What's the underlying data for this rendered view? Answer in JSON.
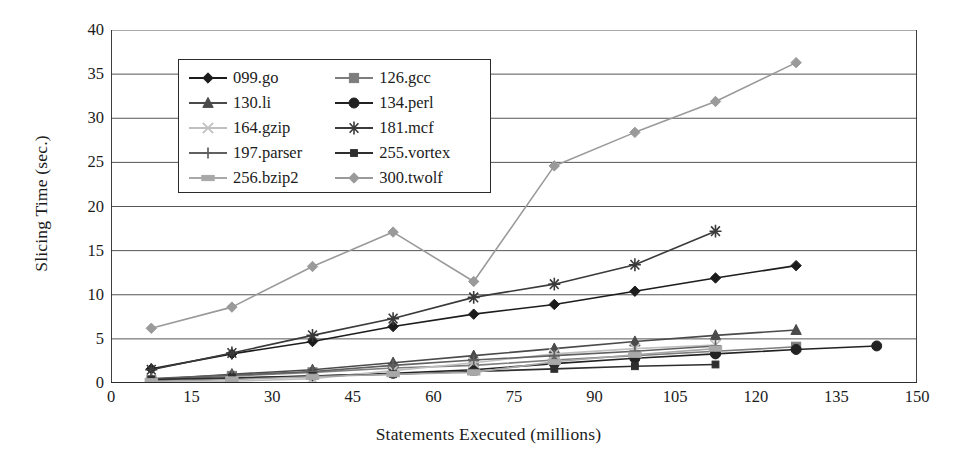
{
  "chart_data": {
    "type": "line",
    "title": "",
    "xlabel": "Statements Executed (millions)",
    "ylabel": "Slicing Time (sec.)",
    "xlim": [
      0,
      150
    ],
    "ylim": [
      0,
      40
    ],
    "xticks": [
      0,
      15,
      30,
      45,
      60,
      75,
      90,
      105,
      120,
      135,
      150
    ],
    "yticks": [
      0,
      5,
      10,
      15,
      20,
      25,
      30,
      35,
      40
    ],
    "grid": "horizontal",
    "legend_position": "upper-left-inside",
    "series": [
      {
        "name": "099.go",
        "color": "#1c1c1c",
        "marker": "diamond",
        "points": [
          [
            7.5,
            1.6
          ],
          [
            22.5,
            3.3
          ],
          [
            37.5,
            4.7
          ],
          [
            52.5,
            6.4
          ],
          [
            67.5,
            7.8
          ],
          [
            82.5,
            8.9
          ],
          [
            97.5,
            10.4
          ],
          [
            112.5,
            11.9
          ],
          [
            127.5,
            13.3
          ]
        ]
      },
      {
        "name": "126.gcc",
        "color": "#7d7d7d",
        "marker": "square",
        "points": [
          [
            7.5,
            0.3
          ],
          [
            22.5,
            0.8
          ],
          [
            37.5,
            1.2
          ],
          [
            52.5,
            1.7
          ],
          [
            67.5,
            2.0
          ],
          [
            82.5,
            2.6
          ],
          [
            97.5,
            3.1
          ],
          [
            112.5,
            3.6
          ],
          [
            127.5,
            4.1
          ]
        ]
      },
      {
        "name": "130.li",
        "color": "#4a4a4a",
        "marker": "triangle",
        "points": [
          [
            7.5,
            0.4
          ],
          [
            22.5,
            1.0
          ],
          [
            37.5,
            1.5
          ],
          [
            52.5,
            2.3
          ],
          [
            67.5,
            3.1
          ],
          [
            82.5,
            3.9
          ],
          [
            97.5,
            4.7
          ],
          [
            112.5,
            5.4
          ],
          [
            127.5,
            6.0
          ]
        ]
      },
      {
        "name": "134.perl",
        "color": "#222222",
        "marker": "circle",
        "points": [
          [
            7.5,
            0.2
          ],
          [
            22.5,
            0.5
          ],
          [
            37.5,
            0.8
          ],
          [
            52.5,
            1.1
          ],
          [
            67.5,
            1.5
          ],
          [
            82.5,
            2.2
          ],
          [
            97.5,
            2.8
          ],
          [
            112.5,
            3.3
          ],
          [
            127.5,
            3.8
          ],
          [
            142.5,
            4.2
          ]
        ]
      },
      {
        "name": "164.gzip",
        "color": "#c0c0c0",
        "marker": "cross",
        "points": [
          [
            7.5,
            0.1
          ],
          [
            22.5,
            0.2
          ],
          [
            37.5,
            0.5
          ],
          [
            52.5,
            1.4
          ],
          [
            67.5,
            2.3
          ],
          [
            82.5,
            3.3
          ],
          [
            97.5,
            3.9
          ],
          [
            112.5,
            4.3
          ]
        ]
      },
      {
        "name": "181.mcf",
        "color": "#3a3a3a",
        "marker": "asterisk",
        "points": [
          [
            7.5,
            1.5
          ],
          [
            22.5,
            3.4
          ],
          [
            37.5,
            5.4
          ],
          [
            52.5,
            7.3
          ],
          [
            67.5,
            9.7
          ],
          [
            82.5,
            11.2
          ],
          [
            97.5,
            13.4
          ],
          [
            112.5,
            17.2
          ]
        ]
      },
      {
        "name": "197.parser",
        "color": "#606060",
        "marker": "plus",
        "points": [
          [
            7.5,
            0.5
          ],
          [
            22.5,
            0.9
          ],
          [
            37.5,
            1.3
          ],
          [
            52.5,
            2.0
          ],
          [
            67.5,
            2.6
          ],
          [
            82.5,
            3.1
          ],
          [
            97.5,
            3.6
          ],
          [
            112.5,
            4.2
          ]
        ]
      },
      {
        "name": "255.vortex",
        "color": "#2e2e2e",
        "marker": "smallsquare",
        "points": [
          [
            7.5,
            0.4
          ],
          [
            22.5,
            0.6
          ],
          [
            37.5,
            0.8
          ],
          [
            52.5,
            1.0
          ],
          [
            67.5,
            1.3
          ],
          [
            82.5,
            1.6
          ],
          [
            97.5,
            1.9
          ],
          [
            112.5,
            2.1
          ]
        ]
      },
      {
        "name": "256.bzip2",
        "color": "#a8a8a8",
        "marker": "wide",
        "points": [
          [
            7.5,
            0.2
          ],
          [
            22.5,
            0.4
          ],
          [
            37.5,
            0.7
          ],
          [
            52.5,
            1.0
          ],
          [
            67.5,
            1.2
          ],
          [
            82.5,
            2.4
          ],
          [
            97.5,
            3.2
          ],
          [
            112.5,
            3.9
          ]
        ]
      },
      {
        "name": "300.twolf",
        "color": "#9a9a9a",
        "marker": "diamond",
        "points": [
          [
            7.5,
            6.2
          ],
          [
            22.5,
            8.6
          ],
          [
            37.5,
            13.2
          ],
          [
            52.5,
            17.1
          ],
          [
            67.5,
            11.5
          ],
          [
            82.5,
            24.6
          ],
          [
            97.5,
            28.4
          ],
          [
            112.5,
            31.9
          ],
          [
            127.5,
            36.3
          ]
        ]
      }
    ]
  },
  "legend": {
    "rows": [
      {
        "left": "099.go",
        "right": "126.gcc"
      },
      {
        "left": "130.li",
        "right": "134.perl"
      },
      {
        "left": "164.gzip",
        "right": "181.mcf"
      },
      {
        "left": "197.parser",
        "right": "255.vortex"
      },
      {
        "left": "256.bzip2",
        "right": "300.twolf"
      }
    ]
  }
}
